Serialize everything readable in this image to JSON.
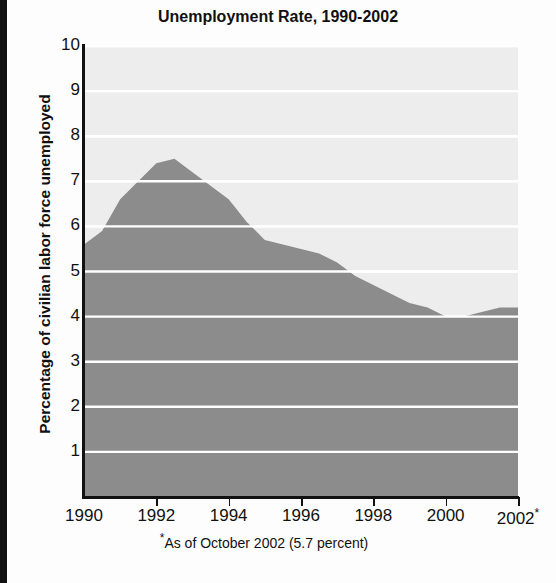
{
  "chart_data": {
    "type": "area",
    "title": "Unemployment Rate, 1990-2002",
    "xlabel": "",
    "ylabel": "Percentage of civilian labor force unemployed",
    "xlim": [
      1990,
      2002
    ],
    "ylim": [
      0,
      10
    ],
    "grid": true,
    "legend": null,
    "footnote": "As of October 2002 (5.7 percent)",
    "footnote_marker": "*",
    "x_tick_labels": [
      "1990",
      "1992",
      "1994",
      "1996",
      "1998",
      "2000",
      "2002*"
    ],
    "x_ticks": [
      1990,
      1992,
      1994,
      1996,
      1998,
      2000,
      2002
    ],
    "y_tick_labels": [
      "10",
      "9",
      "8",
      "7",
      "6",
      "5",
      "4",
      "3",
      "2",
      "1"
    ],
    "y_ticks": [
      10,
      9,
      8,
      7,
      6,
      5,
      4,
      3,
      2,
      1
    ],
    "x": [
      1990,
      1990.5,
      1991,
      1991.5,
      1992,
      1992.5,
      1993,
      1993.5,
      1994,
      1994.5,
      1995,
      1995.5,
      1996,
      1996.5,
      1997,
      1997.5,
      1998,
      1998.5,
      1999,
      1999.5,
      2000,
      2000.5,
      2001,
      2001.5,
      2002,
      2002.8
    ],
    "values": [
      5.6,
      5.9,
      6.6,
      7.0,
      7.4,
      7.5,
      7.2,
      6.9,
      6.6,
      6.1,
      5.7,
      5.6,
      5.5,
      5.4,
      5.2,
      4.9,
      4.7,
      4.5,
      4.3,
      4.2,
      4.0,
      4.0,
      4.1,
      4.2,
      4.2,
      5.7
    ],
    "series_name": "Unemployment rate",
    "series_color": "#8c8c8c",
    "plot_background": "#ededed",
    "gridline_color": "#ffffff",
    "axis_color": "#111111",
    "last_value": 5.7,
    "peak_value": 7.5,
    "peak_year": 1992,
    "min_value": 4.0,
    "min_year": 2000
  },
  "labels": {
    "title": "Unemployment Rate, 1990-2002",
    "ylabel": "Percentage of civilian labor force unemployed",
    "footnote_text": "As of October 2002 (5.7 percent)"
  }
}
